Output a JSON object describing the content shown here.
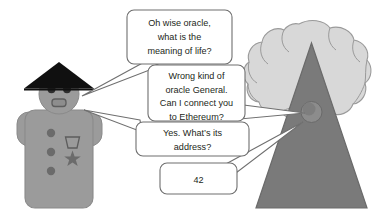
{
  "scene": {
    "title": "Oracle conversation cartoon",
    "background_color": "#ffffff",
    "width": 373,
    "height": 222
  },
  "palette": {
    "body_gray": "#9b9b9b",
    "body_outline": "#8a8a8a",
    "hat_black": "#101010",
    "face_gray": "#9b9b9b",
    "feature_dark": "#4a4a4a",
    "triangle_gray": "#7a7a7a",
    "triangle_outline": "#6a6a6a",
    "cloud_gray": "#d8d8d8",
    "cloud_outline": "#9a9a9a",
    "orb_gray": "#7e7e7e",
    "bubble_fill": "#ffffff",
    "bubble_stroke": "#6f6f6f",
    "text_color": "#231f20"
  },
  "characters": {
    "general": {
      "name": "General",
      "hat": "conical-hat",
      "badge": "medal-trapezoid",
      "star": "star-insignia",
      "button_count": 3
    },
    "oracle": {
      "name": "Oracle",
      "shape": "triangle",
      "orb": "orb-eye",
      "cloud": "cloud-backdrop"
    }
  },
  "bubbles": [
    {
      "id": "bubble-1",
      "speaker": "general",
      "lines": [
        "Oh wise oracle,",
        "what is the",
        "meaning of life?"
      ]
    },
    {
      "id": "bubble-2",
      "speaker": "oracle",
      "lines": [
        "Wrong kind of",
        "oracle General.",
        "Can I connect you",
        "to Ethereum?"
      ]
    },
    {
      "id": "bubble-3",
      "speaker": "general",
      "lines": [
        "Yes. What’s its",
        "address?"
      ]
    },
    {
      "id": "bubble-4",
      "speaker": "oracle",
      "lines": [
        "42"
      ]
    }
  ]
}
